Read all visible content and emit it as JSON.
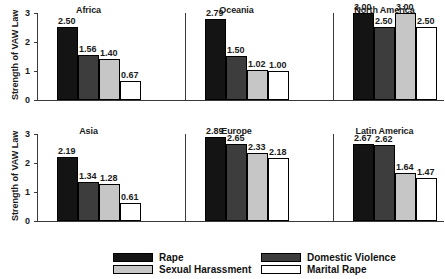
{
  "chart_data": {
    "type": "bar",
    "title": "",
    "xlabel": "",
    "ylabel": "Strength of VAW Law",
    "ylim": [
      0,
      3
    ],
    "yticks": [
      "0",
      "1",
      "2",
      "3"
    ],
    "grid": false,
    "legend_position": "bottom",
    "categories": [
      "Rape",
      "Domestic Violence",
      "Sexual Harassment",
      "Marital Rape"
    ],
    "panels": [
      {
        "title": "Africa",
        "values": [
          2.5,
          1.56,
          1.4,
          0.67
        ],
        "labels": [
          "2.50",
          "1.56",
          "1.40",
          "0.67"
        ]
      },
      {
        "title": "Oceania",
        "values": [
          2.79,
          1.5,
          1.02,
          1.0
        ],
        "labels": [
          "2.79",
          "1.50",
          "1.02",
          "1.00"
        ]
      },
      {
        "title": "North America",
        "values": [
          3.0,
          2.5,
          3.0,
          2.5
        ],
        "labels": [
          "3.00",
          "2.50",
          "3.00",
          "2.50"
        ]
      },
      {
        "title": "Asia",
        "values": [
          2.19,
          1.34,
          1.28,
          0.61
        ],
        "labels": [
          "2.19",
          "1.34",
          "1.28",
          "0.61"
        ]
      },
      {
        "title": "Europe",
        "values": [
          2.89,
          2.65,
          2.33,
          2.18
        ],
        "labels": [
          "2.89",
          "2.65",
          "2.33",
          "2.18"
        ]
      },
      {
        "title": "Latin America",
        "values": [
          2.67,
          2.62,
          1.64,
          1.47
        ],
        "labels": [
          "2.67",
          "2.62",
          "1.64",
          "1.47"
        ]
      }
    ],
    "series_colors": [
      "#141414",
      "#3d3d3d",
      "#c6c6c6",
      "#ffffff"
    ]
  },
  "legend": {
    "items": [
      {
        "label": "Rape",
        "series": 0
      },
      {
        "label": "Domestic Violence",
        "series": 1
      },
      {
        "label": "Sexual Harassment",
        "series": 2
      },
      {
        "label": "Marital Rape",
        "series": 3
      }
    ]
  },
  "axis": {
    "ylabel": "Strength of VAW Law",
    "yticks": [
      "3",
      "2",
      "1",
      "0"
    ]
  }
}
